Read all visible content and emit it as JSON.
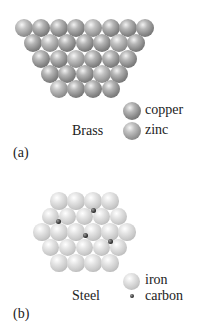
{
  "figure": {
    "panel_a": {
      "caption": "(a)",
      "title": "Brass",
      "legend": [
        {
          "label": "copper",
          "kind": "copper"
        },
        {
          "label": "zinc",
          "kind": "zinc"
        }
      ],
      "rows": [
        8,
        7,
        6,
        5,
        4
      ]
    },
    "panel_b": {
      "caption": "(b)",
      "title": "Steel",
      "legend": [
        {
          "label": "iron",
          "kind": "iron"
        },
        {
          "label": "carbon",
          "kind": "carbon"
        }
      ],
      "rows": [
        4,
        5,
        6,
        5,
        4
      ],
      "carbon_count": 4
    }
  },
  "colors": {
    "copper": "#858585",
    "zinc": "#979797",
    "iron": "#c8c8c8",
    "carbon": "#333333"
  }
}
